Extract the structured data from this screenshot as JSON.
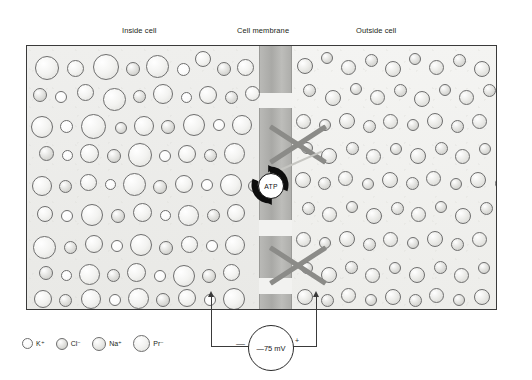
{
  "diagram": {
    "labels": {
      "inside": "Inside cell",
      "membrane": "Cell membrane",
      "outside": "Outside cell"
    },
    "pump": {
      "label": "ATP",
      "name": "sodium-potassium-atpase-pump"
    },
    "voltmeter": {
      "value": "—75 mV",
      "negative_sign": "—",
      "positive_sign": "+"
    },
    "blocked_channels": [
      {
        "name": "blocked-channel-upper"
      },
      {
        "name": "blocked-channel-lower"
      }
    ]
  },
  "legend": {
    "items": [
      {
        "label": "K⁺",
        "kind": "ion-k",
        "size": 11,
        "name": "legend-potassium"
      },
      {
        "label": "Cl⁻",
        "kind": "ion-cl",
        "size": 12,
        "name": "legend-chloride"
      },
      {
        "label": "Na⁺",
        "kind": "ion-na",
        "size": 14,
        "name": "legend-sodium"
      },
      {
        "label": "Pr⁻",
        "kind": "ion-pr",
        "size": 17,
        "name": "legend-protein"
      }
    ]
  },
  "colors": {
    "ink": "#231f20",
    "border": "#3a3a3a",
    "membrane": "#aeaeab",
    "xmark": "#8b8b88",
    "pump": "#111111"
  },
  "geometry": {
    "box": {
      "x": 26,
      "y": 45,
      "w": 471,
      "h": 265
    },
    "membrane": {
      "x": 232,
      "w": 33
    },
    "membrane_segments": [
      {
        "top": 0,
        "height": 47
      },
      {
        "top": 62,
        "height": 112
      },
      {
        "top": 190,
        "height": 42
      },
      {
        "top": 248,
        "height": 17
      }
    ],
    "xmarks": [
      {
        "x": 238,
        "y": 82,
        "size": 66
      },
      {
        "x": 238,
        "y": 248,
        "size": 66
      }
    ],
    "pump": {
      "x": 249,
      "y": 164
    },
    "electrodes": {
      "left_x": 212,
      "right_x": 317,
      "top_y": 290,
      "bottom_y": 347
    }
  },
  "ions_inside": [
    {
      "x": 8,
      "y": 10,
      "d": 24,
      "k": "ion-pr"
    },
    {
      "x": 40,
      "y": 14,
      "d": 17,
      "k": "ion-pr"
    },
    {
      "x": 66,
      "y": 8,
      "d": 26,
      "k": "ion-pr"
    },
    {
      "x": 99,
      "y": 16,
      "d": 14,
      "k": "ion-cl"
    },
    {
      "x": 119,
      "y": 9,
      "d": 23,
      "k": "ion-pr"
    },
    {
      "x": 150,
      "y": 17,
      "d": 13,
      "k": "ion-k"
    },
    {
      "x": 168,
      "y": 5,
      "d": 16,
      "k": "ion-pr"
    },
    {
      "x": 190,
      "y": 16,
      "d": 14,
      "k": "ion-cl"
    },
    {
      "x": 210,
      "y": 13,
      "d": 17,
      "k": "ion-pr"
    },
    {
      "x": 6,
      "y": 42,
      "d": 14,
      "k": "ion-cl"
    },
    {
      "x": 28,
      "y": 45,
      "d": 12,
      "k": "ion-k"
    },
    {
      "x": 50,
      "y": 38,
      "d": 17,
      "k": "ion-pr"
    },
    {
      "x": 76,
      "y": 42,
      "d": 23,
      "k": "ion-pr"
    },
    {
      "x": 106,
      "y": 44,
      "d": 13,
      "k": "ion-cl"
    },
    {
      "x": 126,
      "y": 38,
      "d": 20,
      "k": "ion-pr"
    },
    {
      "x": 154,
      "y": 46,
      "d": 11,
      "k": "ion-k"
    },
    {
      "x": 172,
      "y": 40,
      "d": 18,
      "k": "ion-pr"
    },
    {
      "x": 198,
      "y": 45,
      "d": 13,
      "k": "ion-cl"
    },
    {
      "x": 218,
      "y": 40,
      "d": 15,
      "k": "ion-pr"
    },
    {
      "x": 4,
      "y": 70,
      "d": 22,
      "k": "ion-pr"
    },
    {
      "x": 33,
      "y": 74,
      "d": 13,
      "k": "ion-k"
    },
    {
      "x": 54,
      "y": 68,
      "d": 25,
      "k": "ion-pr"
    },
    {
      "x": 88,
      "y": 76,
      "d": 12,
      "k": "ion-cl"
    },
    {
      "x": 107,
      "y": 70,
      "d": 20,
      "k": "ion-pr"
    },
    {
      "x": 134,
      "y": 74,
      "d": 14,
      "k": "ion-cl"
    },
    {
      "x": 156,
      "y": 68,
      "d": 22,
      "k": "ion-pr"
    },
    {
      "x": 186,
      "y": 73,
      "d": 12,
      "k": "ion-k"
    },
    {
      "x": 205,
      "y": 69,
      "d": 20,
      "k": "ion-pr"
    },
    {
      "x": 12,
      "y": 100,
      "d": 15,
      "k": "ion-cl"
    },
    {
      "x": 35,
      "y": 104,
      "d": 11,
      "k": "ion-k"
    },
    {
      "x": 53,
      "y": 98,
      "d": 19,
      "k": "ion-pr"
    },
    {
      "x": 80,
      "y": 103,
      "d": 14,
      "k": "ion-cl"
    },
    {
      "x": 101,
      "y": 97,
      "d": 24,
      "k": "ion-pr"
    },
    {
      "x": 132,
      "y": 104,
      "d": 12,
      "k": "ion-k"
    },
    {
      "x": 151,
      "y": 99,
      "d": 18,
      "k": "ion-pr"
    },
    {
      "x": 177,
      "y": 103,
      "d": 13,
      "k": "ion-cl"
    },
    {
      "x": 197,
      "y": 97,
      "d": 21,
      "k": "ion-pr"
    },
    {
      "x": 5,
      "y": 130,
      "d": 20,
      "k": "ion-pr"
    },
    {
      "x": 32,
      "y": 134,
      "d": 13,
      "k": "ion-cl"
    },
    {
      "x": 53,
      "y": 128,
      "d": 17,
      "k": "ion-pr"
    },
    {
      "x": 78,
      "y": 133,
      "d": 11,
      "k": "ion-k"
    },
    {
      "x": 96,
      "y": 127,
      "d": 23,
      "k": "ion-pr"
    },
    {
      "x": 126,
      "y": 134,
      "d": 14,
      "k": "ion-cl"
    },
    {
      "x": 148,
      "y": 129,
      "d": 18,
      "k": "ion-pr"
    },
    {
      "x": 174,
      "y": 133,
      "d": 12,
      "k": "ion-k"
    },
    {
      "x": 193,
      "y": 128,
      "d": 22,
      "k": "ion-pr"
    },
    {
      "x": 221,
      "y": 134,
      "d": 12,
      "k": "ion-cl"
    },
    {
      "x": 10,
      "y": 160,
      "d": 16,
      "k": "ion-pr"
    },
    {
      "x": 34,
      "y": 164,
      "d": 12,
      "k": "ion-k"
    },
    {
      "x": 54,
      "y": 158,
      "d": 22,
      "k": "ion-pr"
    },
    {
      "x": 84,
      "y": 163,
      "d": 14,
      "k": "ion-cl"
    },
    {
      "x": 106,
      "y": 157,
      "d": 19,
      "k": "ion-pr"
    },
    {
      "x": 133,
      "y": 164,
      "d": 11,
      "k": "ion-k"
    },
    {
      "x": 151,
      "y": 159,
      "d": 21,
      "k": "ion-pr"
    },
    {
      "x": 180,
      "y": 163,
      "d": 13,
      "k": "ion-cl"
    },
    {
      "x": 200,
      "y": 158,
      "d": 18,
      "k": "ion-pr"
    },
    {
      "x": 6,
      "y": 190,
      "d": 23,
      "k": "ion-pr"
    },
    {
      "x": 37,
      "y": 195,
      "d": 13,
      "k": "ion-cl"
    },
    {
      "x": 58,
      "y": 189,
      "d": 18,
      "k": "ion-pr"
    },
    {
      "x": 84,
      "y": 194,
      "d": 12,
      "k": "ion-k"
    },
    {
      "x": 103,
      "y": 188,
      "d": 22,
      "k": "ion-pr"
    },
    {
      "x": 132,
      "y": 195,
      "d": 14,
      "k": "ion-cl"
    },
    {
      "x": 154,
      "y": 190,
      "d": 17,
      "k": "ion-pr"
    },
    {
      "x": 179,
      "y": 194,
      "d": 12,
      "k": "ion-k"
    },
    {
      "x": 198,
      "y": 189,
      "d": 20,
      "k": "ion-pr"
    },
    {
      "x": 12,
      "y": 220,
      "d": 14,
      "k": "ion-cl"
    },
    {
      "x": 34,
      "y": 224,
      "d": 11,
      "k": "ion-k"
    },
    {
      "x": 52,
      "y": 218,
      "d": 21,
      "k": "ion-pr"
    },
    {
      "x": 80,
      "y": 223,
      "d": 13,
      "k": "ion-cl"
    },
    {
      "x": 100,
      "y": 217,
      "d": 19,
      "k": "ion-pr"
    },
    {
      "x": 127,
      "y": 224,
      "d": 12,
      "k": "ion-k"
    },
    {
      "x": 146,
      "y": 219,
      "d": 22,
      "k": "ion-pr"
    },
    {
      "x": 175,
      "y": 223,
      "d": 14,
      "k": "ion-cl"
    },
    {
      "x": 196,
      "y": 218,
      "d": 17,
      "k": "ion-pr"
    },
    {
      "x": 7,
      "y": 244,
      "d": 18,
      "k": "ion-pr"
    },
    {
      "x": 32,
      "y": 248,
      "d": 13,
      "k": "ion-cl"
    },
    {
      "x": 54,
      "y": 243,
      "d": 20,
      "k": "ion-pr"
    },
    {
      "x": 82,
      "y": 248,
      "d": 12,
      "k": "ion-k"
    },
    {
      "x": 101,
      "y": 242,
      "d": 21,
      "k": "ion-pr"
    },
    {
      "x": 129,
      "y": 247,
      "d": 14,
      "k": "ion-cl"
    },
    {
      "x": 151,
      "y": 243,
      "d": 18,
      "k": "ion-pr"
    },
    {
      "x": 177,
      "y": 248,
      "d": 12,
      "k": "ion-k"
    },
    {
      "x": 196,
      "y": 242,
      "d": 22,
      "k": "ion-pr"
    }
  ],
  "ions_outside": [
    {
      "x": 4,
      "y": 12,
      "d": 16,
      "k": "ion-na"
    },
    {
      "x": 28,
      "y": 6,
      "d": 12,
      "k": "ion-cl"
    },
    {
      "x": 48,
      "y": 14,
      "d": 15,
      "k": "ion-na"
    },
    {
      "x": 72,
      "y": 8,
      "d": 13,
      "k": "ion-cl"
    },
    {
      "x": 92,
      "y": 15,
      "d": 16,
      "k": "ion-na"
    },
    {
      "x": 116,
      "y": 7,
      "d": 12,
      "k": "ion-cl"
    },
    {
      "x": 136,
      "y": 14,
      "d": 15,
      "k": "ion-na"
    },
    {
      "x": 160,
      "y": 8,
      "d": 13,
      "k": "ion-cl"
    },
    {
      "x": 181,
      "y": 15,
      "d": 16,
      "k": "ion-na"
    },
    {
      "x": 206,
      "y": 9,
      "d": 12,
      "k": "ion-cl"
    },
    {
      "x": 10,
      "y": 38,
      "d": 13,
      "k": "ion-cl"
    },
    {
      "x": 32,
      "y": 44,
      "d": 16,
      "k": "ion-na"
    },
    {
      "x": 57,
      "y": 37,
      "d": 12,
      "k": "ion-cl"
    },
    {
      "x": 77,
      "y": 44,
      "d": 15,
      "k": "ion-na"
    },
    {
      "x": 101,
      "y": 38,
      "d": 13,
      "k": "ion-cl"
    },
    {
      "x": 121,
      "y": 45,
      "d": 16,
      "k": "ion-na"
    },
    {
      "x": 146,
      "y": 38,
      "d": 12,
      "k": "ion-cl"
    },
    {
      "x": 166,
      "y": 44,
      "d": 15,
      "k": "ion-na"
    },
    {
      "x": 190,
      "y": 38,
      "d": 13,
      "k": "ion-cl"
    },
    {
      "x": 210,
      "y": 45,
      "d": 15,
      "k": "ion-na"
    },
    {
      "x": 3,
      "y": 68,
      "d": 15,
      "k": "ion-na"
    },
    {
      "x": 26,
      "y": 73,
      "d": 12,
      "k": "ion-cl"
    },
    {
      "x": 46,
      "y": 67,
      "d": 16,
      "k": "ion-na"
    },
    {
      "x": 70,
      "y": 74,
      "d": 13,
      "k": "ion-cl"
    },
    {
      "x": 90,
      "y": 68,
      "d": 15,
      "k": "ion-na"
    },
    {
      "x": 114,
      "y": 73,
      "d": 12,
      "k": "ion-cl"
    },
    {
      "x": 134,
      "y": 67,
      "d": 16,
      "k": "ion-na"
    },
    {
      "x": 158,
      "y": 74,
      "d": 13,
      "k": "ion-cl"
    },
    {
      "x": 179,
      "y": 68,
      "d": 15,
      "k": "ion-na"
    },
    {
      "x": 203,
      "y": 73,
      "d": 12,
      "k": "ion-cl"
    },
    {
      "x": 8,
      "y": 96,
      "d": 12,
      "k": "ion-cl"
    },
    {
      "x": 28,
      "y": 102,
      "d": 16,
      "k": "ion-na"
    },
    {
      "x": 53,
      "y": 96,
      "d": 13,
      "k": "ion-cl"
    },
    {
      "x": 73,
      "y": 103,
      "d": 15,
      "k": "ion-na"
    },
    {
      "x": 97,
      "y": 97,
      "d": 12,
      "k": "ion-cl"
    },
    {
      "x": 117,
      "y": 102,
      "d": 16,
      "k": "ion-na"
    },
    {
      "x": 142,
      "y": 96,
      "d": 13,
      "k": "ion-cl"
    },
    {
      "x": 162,
      "y": 103,
      "d": 15,
      "k": "ion-na"
    },
    {
      "x": 186,
      "y": 97,
      "d": 12,
      "k": "ion-cl"
    },
    {
      "x": 206,
      "y": 102,
      "d": 16,
      "k": "ion-na"
    },
    {
      "x": 2,
      "y": 126,
      "d": 16,
      "k": "ion-na"
    },
    {
      "x": 25,
      "y": 131,
      "d": 13,
      "k": "ion-cl"
    },
    {
      "x": 45,
      "y": 125,
      "d": 15,
      "k": "ion-na"
    },
    {
      "x": 69,
      "y": 132,
      "d": 12,
      "k": "ion-cl"
    },
    {
      "x": 89,
      "y": 126,
      "d": 16,
      "k": "ion-na"
    },
    {
      "x": 113,
      "y": 131,
      "d": 13,
      "k": "ion-cl"
    },
    {
      "x": 133,
      "y": 125,
      "d": 15,
      "k": "ion-na"
    },
    {
      "x": 157,
      "y": 132,
      "d": 12,
      "k": "ion-cl"
    },
    {
      "x": 177,
      "y": 126,
      "d": 16,
      "k": "ion-na"
    },
    {
      "x": 202,
      "y": 131,
      "d": 13,
      "k": "ion-cl"
    },
    {
      "x": 9,
      "y": 156,
      "d": 13,
      "k": "ion-cl"
    },
    {
      "x": 29,
      "y": 161,
      "d": 15,
      "k": "ion-na"
    },
    {
      "x": 53,
      "y": 155,
      "d": 12,
      "k": "ion-cl"
    },
    {
      "x": 73,
      "y": 162,
      "d": 16,
      "k": "ion-na"
    },
    {
      "x": 98,
      "y": 156,
      "d": 13,
      "k": "ion-cl"
    },
    {
      "x": 118,
      "y": 161,
      "d": 15,
      "k": "ion-na"
    },
    {
      "x": 142,
      "y": 155,
      "d": 12,
      "k": "ion-cl"
    },
    {
      "x": 162,
      "y": 162,
      "d": 16,
      "k": "ion-na"
    },
    {
      "x": 187,
      "y": 156,
      "d": 13,
      "k": "ion-cl"
    },
    {
      "x": 207,
      "y": 161,
      "d": 15,
      "k": "ion-na"
    },
    {
      "x": 3,
      "y": 186,
      "d": 15,
      "k": "ion-na"
    },
    {
      "x": 26,
      "y": 191,
      "d": 12,
      "k": "ion-cl"
    },
    {
      "x": 46,
      "y": 185,
      "d": 16,
      "k": "ion-na"
    },
    {
      "x": 70,
      "y": 192,
      "d": 13,
      "k": "ion-cl"
    },
    {
      "x": 90,
      "y": 186,
      "d": 15,
      "k": "ion-na"
    },
    {
      "x": 114,
      "y": 191,
      "d": 12,
      "k": "ion-cl"
    },
    {
      "x": 134,
      "y": 185,
      "d": 16,
      "k": "ion-na"
    },
    {
      "x": 158,
      "y": 192,
      "d": 13,
      "k": "ion-cl"
    },
    {
      "x": 179,
      "y": 186,
      "d": 15,
      "k": "ion-na"
    },
    {
      "x": 203,
      "y": 191,
      "d": 12,
      "k": "ion-cl"
    },
    {
      "x": 8,
      "y": 216,
      "d": 12,
      "k": "ion-cl"
    },
    {
      "x": 28,
      "y": 221,
      "d": 16,
      "k": "ion-na"
    },
    {
      "x": 52,
      "y": 215,
      "d": 13,
      "k": "ion-cl"
    },
    {
      "x": 72,
      "y": 222,
      "d": 15,
      "k": "ion-na"
    },
    {
      "x": 96,
      "y": 216,
      "d": 12,
      "k": "ion-cl"
    },
    {
      "x": 116,
      "y": 221,
      "d": 16,
      "k": "ion-na"
    },
    {
      "x": 141,
      "y": 215,
      "d": 13,
      "k": "ion-cl"
    },
    {
      "x": 161,
      "y": 222,
      "d": 15,
      "k": "ion-na"
    },
    {
      "x": 185,
      "y": 216,
      "d": 12,
      "k": "ion-cl"
    },
    {
      "x": 205,
      "y": 221,
      "d": 16,
      "k": "ion-na"
    },
    {
      "x": 4,
      "y": 243,
      "d": 16,
      "k": "ion-na"
    },
    {
      "x": 28,
      "y": 248,
      "d": 13,
      "k": "ion-cl"
    },
    {
      "x": 48,
      "y": 242,
      "d": 15,
      "k": "ion-na"
    },
    {
      "x": 72,
      "y": 248,
      "d": 12,
      "k": "ion-cl"
    },
    {
      "x": 92,
      "y": 243,
      "d": 16,
      "k": "ion-na"
    },
    {
      "x": 116,
      "y": 248,
      "d": 13,
      "k": "ion-cl"
    },
    {
      "x": 136,
      "y": 242,
      "d": 15,
      "k": "ion-na"
    },
    {
      "x": 160,
      "y": 248,
      "d": 12,
      "k": "ion-cl"
    },
    {
      "x": 181,
      "y": 243,
      "d": 16,
      "k": "ion-na"
    },
    {
      "x": 205,
      "y": 248,
      "d": 13,
      "k": "ion-cl"
    }
  ]
}
